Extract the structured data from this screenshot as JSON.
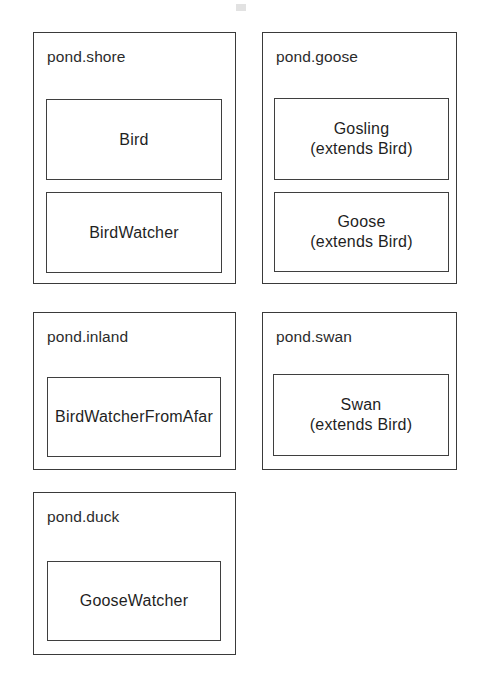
{
  "diagram": {
    "kind": "uml-package-diagram",
    "width": 485,
    "height": 685,
    "background_color": "#ffffff",
    "line_color": "#3a3a3a",
    "text_color": "#1f1f1f"
  },
  "packages": [
    {
      "name": "pond.shore",
      "x": 33,
      "y": 32,
      "w": 203,
      "h": 252,
      "classes": [
        {
          "name": "Bird",
          "extends": "",
          "x": 12,
          "y": 66,
          "w": 176,
          "h": 81
        },
        {
          "name": "BirdWatcher",
          "extends": "",
          "x": 12,
          "y": 159,
          "w": 176,
          "h": 81
        }
      ]
    },
    {
      "name": "pond.goose",
      "x": 262,
      "y": 32,
      "w": 195,
      "h": 252,
      "classes": [
        {
          "name": "Gosling",
          "extends": "(extends Bird)",
          "x": 11,
          "y": 65,
          "w": 175,
          "h": 82
        },
        {
          "name": "Goose",
          "extends": "(extends Bird)",
          "x": 11,
          "y": 159,
          "w": 175,
          "h": 80
        }
      ]
    },
    {
      "name": "pond.inland",
      "x": 33,
      "y": 312,
      "w": 203,
      "h": 158,
      "classes": [
        {
          "name": "BirdWatcherFromAfar",
          "extends": "",
          "x": 13,
          "y": 64,
          "w": 174,
          "h": 80
        }
      ]
    },
    {
      "name": "pond.swan",
      "x": 262,
      "y": 312,
      "w": 195,
      "h": 158,
      "classes": [
        {
          "name": "Swan",
          "extends": "(extends Bird)",
          "x": 10,
          "y": 61,
          "w": 176,
          "h": 82
        }
      ]
    },
    {
      "name": "pond.duck",
      "x": 33,
      "y": 492,
      "w": 203,
      "h": 163,
      "classes": [
        {
          "name": "GooseWatcher",
          "extends": "",
          "x": 13,
          "y": 68,
          "w": 174,
          "h": 80
        }
      ]
    }
  ]
}
